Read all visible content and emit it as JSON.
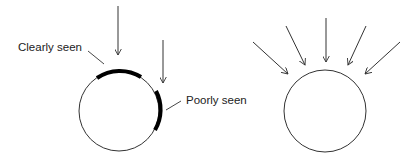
{
  "diagram": {
    "left_panel": {
      "labels": {
        "clearly_seen": "Clearly seen",
        "poorly_seen": "Poorly seen"
      },
      "circle": {
        "cx": 119,
        "cy": 111,
        "r": 40
      },
      "arrows": [
        {
          "x1": 118,
          "y1": 6,
          "x2": 118,
          "y2": 55
        },
        {
          "x1": 163,
          "y1": 40,
          "x2": 163,
          "y2": 83
        }
      ]
    },
    "right_panel": {
      "circle": {
        "cx": 325,
        "cy": 111,
        "r": 41
      },
      "arrows": [
        {
          "x1": 253,
          "y1": 42,
          "x2": 288,
          "y2": 74
        },
        {
          "x1": 286,
          "y1": 26,
          "x2": 305,
          "y2": 65
        },
        {
          "x1": 326,
          "y1": 18,
          "x2": 326,
          "y2": 62
        },
        {
          "x1": 366,
          "y1": 26,
          "x2": 348,
          "y2": 65
        },
        {
          "x1": 400,
          "y1": 42,
          "x2": 365,
          "y2": 74
        }
      ]
    },
    "colors": {
      "line": "#333333",
      "highlight": "#000000",
      "text": "#222222",
      "background": "#ffffff"
    }
  }
}
